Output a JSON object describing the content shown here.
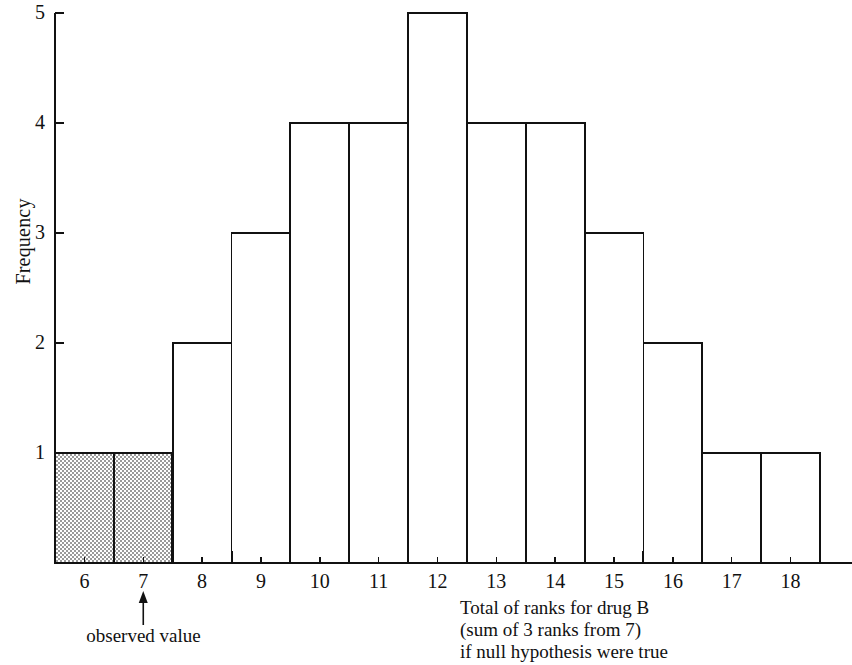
{
  "chart_data": {
    "type": "bar",
    "title": "",
    "subtitle": "",
    "xlabel": "Total of ranks for drug B (sum of 3 ranks from 7) if null hypothesis were true",
    "ylabel": "Frequency",
    "categories": [
      6,
      7,
      8,
      9,
      10,
      11,
      12,
      13,
      14,
      15,
      16,
      17,
      18
    ],
    "values": [
      1,
      1,
      2,
      3,
      4,
      4,
      5,
      4,
      4,
      3,
      2,
      1,
      1
    ],
    "xtick_labels": [
      "6",
      "7",
      "8",
      "9",
      "10",
      "11",
      "12",
      "13",
      "14",
      "15",
      "16",
      "17",
      "18"
    ],
    "ytick_labels": [
      "1",
      "2",
      "3",
      "4",
      "5"
    ],
    "ytick_values": [
      1,
      2,
      3,
      4,
      5
    ],
    "ylim": [
      0,
      5
    ],
    "xlim": [
      5.5,
      18.5
    ],
    "grid": false,
    "legend": null,
    "shaded_categories": [
      6,
      7
    ],
    "shaded_note": "bars for totals 6 and 7 are stippled grey (rejection tail)",
    "bar_fill": "#ffffff",
    "bar_shaded_fill": "#c8c8c8",
    "bar_stroke": "#111111",
    "axis_color": "#111111",
    "annotations": [
      {
        "name": "observed-value",
        "text": "observed value",
        "at_x": 7,
        "arrow": "up"
      }
    ]
  },
  "axis": {
    "y_title": "Frequency",
    "x_caption_lines": [
      "Total of ranks for drug B",
      "(sum of 3 ranks from 7)",
      "if null hypothesis were true"
    ]
  },
  "annotation": {
    "observed_value_label": "observed value"
  },
  "colors": {
    "ink": "#111111",
    "shade": "#c8c8c8",
    "paper": "#ffffff"
  }
}
